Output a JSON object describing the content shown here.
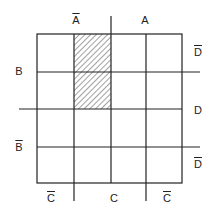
{
  "diagram": {
    "type": "karnaugh-map",
    "grid": {
      "rows": 4,
      "cols": 4
    },
    "line_color": "#222222",
    "hatch_color": "#444444",
    "shaded_cells": [
      {
        "row": 0,
        "col": 1
      },
      {
        "row": 1,
        "col": 1
      }
    ],
    "top_labels": {
      "not_a": "A",
      "a": "A"
    },
    "left_labels": {
      "b": "B",
      "not_b": "B"
    },
    "right_labels": {
      "not_d_top": "D",
      "d": "D",
      "not_d_bottom": "D"
    },
    "bottom_labels": {
      "not_c_left": "C",
      "c": "C",
      "not_c_right": "C"
    }
  }
}
